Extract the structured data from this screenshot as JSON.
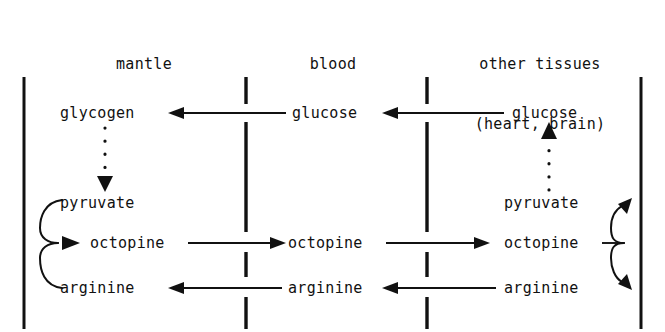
{
  "diagram": {
    "background_color": "#ffffff",
    "ink_color": "#111111",
    "columns": [
      {
        "id": "mantle",
        "header_line1": "mantle",
        "header_line2": ""
      },
      {
        "id": "blood",
        "header_line1": "blood",
        "header_line2": ""
      },
      {
        "id": "other_tissues",
        "header_line1": "other tissues",
        "header_line2": "(heart, brain)"
      }
    ],
    "nodes": {
      "mantle_glycogen": "glycogen",
      "mantle_pyruvate": "pyruvate",
      "mantle_octopine": "octopine",
      "mantle_arginine": "arginine",
      "blood_glucose": "glucose",
      "blood_octopine": "octopine",
      "blood_arginine": "arginine",
      "tissue_glucose": "glucose",
      "tissue_pyruvate": "pyruvate",
      "tissue_octopine": "octopine",
      "tissue_arginine": "arginine"
    },
    "boundaries": {
      "left_wall": "solid",
      "right_wall": "solid",
      "mantle_blood_membrane": "dashed",
      "blood_tissue_membrane": "dashed"
    },
    "edges": [
      {
        "id": "glucose-to-glycogen",
        "from": "blood_glucose",
        "to": "mantle_glycogen",
        "style": "solid",
        "direction": "left"
      },
      {
        "id": "tissue-glucose-to-blood",
        "from": "tissue_glucose",
        "to": "blood_glucose",
        "style": "solid",
        "direction": "left"
      },
      {
        "id": "glycogen-to-pyruvate",
        "from": "mantle_glycogen",
        "to": "mantle_pyruvate",
        "style": "dotted",
        "direction": "down"
      },
      {
        "id": "tissue-pyruvate-to-glucose",
        "from": "tissue_pyruvate",
        "to": "tissue_glucose",
        "style": "dotted",
        "direction": "up"
      },
      {
        "id": "mantle-octopine-synthesis",
        "from": "mantle_pyruvate + mantle_arginine",
        "to": "mantle_octopine",
        "style": "brace",
        "direction": "converging"
      },
      {
        "id": "mantle-octopine-to-blood",
        "from": "mantle_octopine",
        "to": "blood_octopine",
        "style": "solid",
        "direction": "right"
      },
      {
        "id": "blood-octopine-to-tissue",
        "from": "blood_octopine",
        "to": "tissue_octopine",
        "style": "solid",
        "direction": "right"
      },
      {
        "id": "tissue-octopine-breakdown",
        "from": "tissue_octopine",
        "to": "tissue_pyruvate + tissue_arginine",
        "style": "brace",
        "direction": "diverging"
      },
      {
        "id": "tissue-arginine-to-blood",
        "from": "tissue_arginine",
        "to": "blood_arginine",
        "style": "solid",
        "direction": "left"
      },
      {
        "id": "blood-arginine-to-mantle",
        "from": "blood_arginine",
        "to": "mantle_arginine",
        "style": "solid",
        "direction": "left"
      }
    ]
  }
}
